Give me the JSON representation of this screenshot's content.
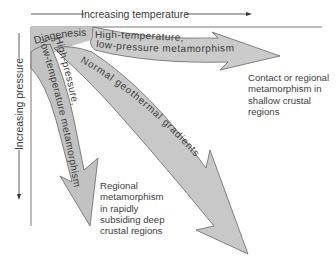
{
  "axes": {
    "x_label": "Increasing temperature",
    "y_label": "Increasing pressure"
  },
  "regions": {
    "diagenesis": "Diagenesis"
  },
  "arrows": [
    {
      "id": "high-temp-low-pressure",
      "line1": "High-temperature,",
      "line2": "low-pressure metamorphism",
      "fill": "#c8c8c8"
    },
    {
      "id": "normal-geothermal",
      "line1": "Normal geothermal gradients",
      "fill": "#c8c8c8"
    },
    {
      "id": "high-pressure-low-temp",
      "line1": "High-pressure,",
      "line2": "low-temperature metamorphism",
      "fill": "#c0c0c0"
    }
  ],
  "notes": {
    "shallow": "Contact or regional\nmetamorphism in\nshallow crustal\nregions",
    "deep": "Regional\nmetamorphism\nin rapidly\nsubsiding deep\ncrustal regions"
  }
}
